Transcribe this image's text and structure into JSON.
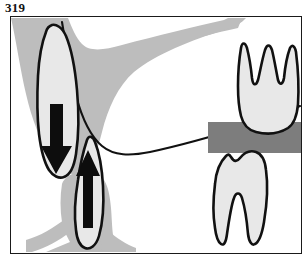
{
  "figure": {
    "number": "319",
    "caption_visible": false,
    "domain_subject": "dental-anatomy-tooth-eruption-diagram",
    "panel": {
      "border_color": "#1a1a1a",
      "border_width_px": 1,
      "background_color": "#ffffff",
      "x": 10,
      "y": 16,
      "width": 292,
      "height": 238
    }
  },
  "colors": {
    "outline": "#111111",
    "tooth_fill": "#e8e8e8",
    "bone_light_gray": "#bdbdbd",
    "occlusal_band_gray": "#7d7d7d",
    "arrow_black": "#0d0d0d",
    "page_background": "#ffffff"
  },
  "elements": {
    "maxilla_bone": {
      "label": "maxillary-bone-shading",
      "fill": "#bdbdbd",
      "description": "light gray bone sweeping from upper left down and curving right along the palate"
    },
    "palate_curve": {
      "label": "palate-outline-curve",
      "stroke": "#111111",
      "description": "black curved line forming the inferior border of the maxillary arch"
    },
    "mandible_bone": {
      "label": "mandibular-bone-shading",
      "fill": "#bdbdbd",
      "description": "light gray bone spreading at lower left beneath the erupting lower tooth"
    },
    "occlusal_band": {
      "label": "occlusal-plane-band",
      "fill": "#7d7d7d",
      "description": "dark gray horizontal band separating the upper and lower right molars"
    }
  },
  "teeth": [
    {
      "id": "upper-left-tooth",
      "name": "erupting-upper-tooth",
      "position": "upper-left",
      "roots": 1,
      "fill": "#e8e8e8",
      "outline": "#111111",
      "arrow": {
        "name": "down-arrow",
        "direction": "down",
        "color": "#0d0d0d",
        "meaning": "eruption direction downward"
      }
    },
    {
      "id": "lower-left-tooth",
      "name": "erupting-lower-tooth",
      "position": "lower-left",
      "roots": 1,
      "fill": "#e8e8e8",
      "outline": "#111111",
      "arrow": {
        "name": "up-arrow",
        "direction": "up",
        "color": "#0d0d0d",
        "meaning": "eruption direction upward"
      }
    },
    {
      "id": "upper-right-molar",
      "name": "maxillary-molar",
      "position": "upper-right",
      "roots": 3,
      "fill": "#e8e8e8",
      "outline": "#111111",
      "arrow": null
    },
    {
      "id": "lower-right-molar",
      "name": "mandibular-molar",
      "position": "lower-right",
      "roots": 2,
      "fill": "#e8e8e8",
      "outline": "#111111",
      "arrow": null
    }
  ]
}
